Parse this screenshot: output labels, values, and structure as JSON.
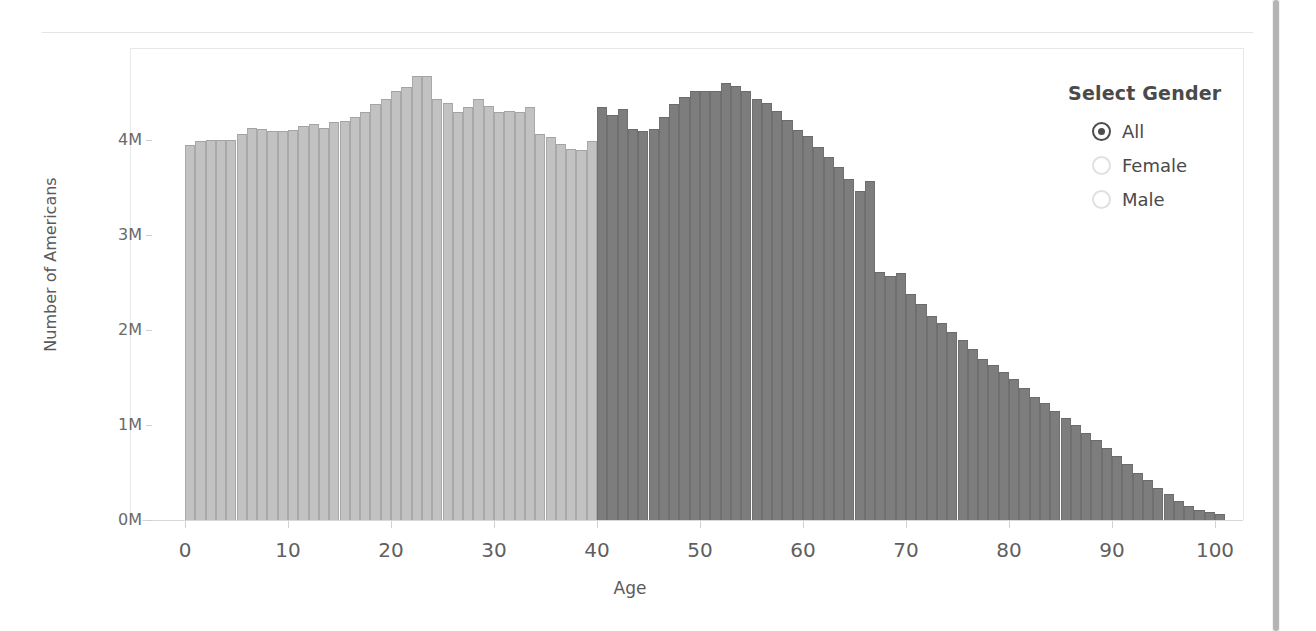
{
  "legend": {
    "title": "Select Gender",
    "options": [
      {
        "label": "All",
        "selected": true
      },
      {
        "label": "Female",
        "selected": false
      },
      {
        "label": "Male",
        "selected": false
      }
    ]
  },
  "colors": {
    "bar_light": "#c2c2c2",
    "bar_dark": "#7d7d7d",
    "axis": "#d8d8d8",
    "text": "#5a5a5a"
  },
  "chart_data": {
    "type": "bar",
    "title": "",
    "xlabel": "Age",
    "ylabel": "Number of Americans",
    "xlim": [
      0,
      100
    ],
    "ylim": [
      0,
      4800000
    ],
    "grid": false,
    "legend_position": "right",
    "x_tick_labels": [
      "0",
      "10",
      "20",
      "30",
      "40",
      "50",
      "60",
      "70",
      "80",
      "90",
      "100"
    ],
    "x_tick_values": [
      0,
      10,
      20,
      30,
      40,
      50,
      60,
      70,
      80,
      90,
      100
    ],
    "y_tick_labels": [
      "0M",
      "1M",
      "2M",
      "3M",
      "4M"
    ],
    "y_tick_values": [
      0,
      1000000,
      2000000,
      3000000,
      4000000
    ],
    "series": [
      {
        "name": "Number of Americans by Age",
        "color_light": "#c2c2c2",
        "color_dark": "#7d7d7d",
        "split_age": 40,
        "categories": [
          0,
          1,
          2,
          3,
          4,
          5,
          6,
          7,
          8,
          9,
          10,
          11,
          12,
          13,
          14,
          15,
          16,
          17,
          18,
          19,
          20,
          21,
          22,
          23,
          24,
          25,
          26,
          27,
          28,
          29,
          30,
          31,
          32,
          33,
          34,
          35,
          36,
          37,
          38,
          39,
          40,
          41,
          42,
          43,
          44,
          45,
          46,
          47,
          48,
          49,
          50,
          51,
          52,
          53,
          54,
          55,
          56,
          57,
          58,
          59,
          60,
          61,
          62,
          63,
          64,
          65,
          66,
          67,
          68,
          69,
          70,
          71,
          72,
          73,
          74,
          75,
          76,
          77,
          78,
          79,
          80,
          81,
          82,
          83,
          84,
          85,
          86,
          87,
          88,
          89,
          90,
          91,
          92,
          93,
          94,
          95,
          96,
          97,
          98,
          99,
          100
        ],
        "values": [
          3950000,
          3990000,
          4000000,
          4000000,
          4000000,
          4060000,
          4130000,
          4120000,
          4090000,
          4090000,
          4110000,
          4150000,
          4170000,
          4130000,
          4190000,
          4200000,
          4240000,
          4300000,
          4380000,
          4430000,
          4520000,
          4560000,
          4670000,
          4670000,
          4430000,
          4390000,
          4300000,
          4350000,
          4430000,
          4360000,
          4300000,
          4310000,
          4290000,
          4350000,
          4060000,
          4030000,
          3960000,
          3910000,
          3890000,
          3990000,
          4350000,
          4260000,
          4330000,
          4120000,
          4100000,
          4120000,
          4240000,
          4380000,
          4450000,
          4520000,
          4520000,
          4520000,
          4600000,
          4570000,
          4520000,
          4430000,
          4390000,
          4310000,
          4210000,
          4110000,
          4040000,
          3930000,
          3820000,
          3720000,
          3590000,
          3460000,
          3570000,
          2610000,
          2570000,
          2600000,
          2380000,
          2270000,
          2150000,
          2070000,
          1980000,
          1890000,
          1800000,
          1700000,
          1630000,
          1560000,
          1480000,
          1390000,
          1300000,
          1230000,
          1150000,
          1070000,
          1000000,
          920000,
          840000,
          760000,
          670000,
          590000,
          500000,
          420000,
          340000,
          270000,
          200000,
          150000,
          110000,
          80000,
          60000
        ]
      }
    ]
  }
}
